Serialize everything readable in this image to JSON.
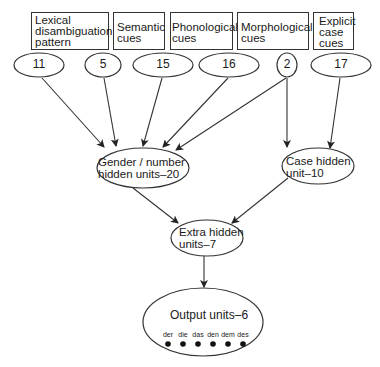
{
  "diagram": {
    "inputs": [
      {
        "label": "Lexical disambiguation pattern",
        "lines": [
          "Lexical",
          "disambiguation",
          "pattern"
        ],
        "units": "11"
      },
      {
        "label": "Semantic cues",
        "lines": [
          "Semantic",
          "cues"
        ],
        "units": "5"
      },
      {
        "label": "Phonological cues",
        "lines": [
          "Phonological",
          "cues"
        ],
        "units": "15"
      },
      {
        "label": "Morphological cues",
        "lines": [
          "Morphological",
          "cues"
        ],
        "units": "16"
      },
      {
        "label": "Morphological cues (2)",
        "units": "2"
      },
      {
        "label": "Explicit case cues",
        "lines": [
          "Explicit",
          "case",
          "cues"
        ],
        "units": "17"
      }
    ],
    "hidden": {
      "gender": {
        "lines": [
          "Gender / number",
          "hidden units–20"
        ]
      },
      "case": {
        "lines": [
          "Case hidden",
          "unit–10"
        ]
      },
      "extra": {
        "lines": [
          "Extra hidden",
          "units–7"
        ]
      }
    },
    "output": {
      "title": "Output units–6",
      "articles": [
        "der",
        "die",
        "das",
        "den",
        "dem",
        "des"
      ]
    },
    "edges": [
      [
        "11",
        "gender"
      ],
      [
        "5",
        "gender"
      ],
      [
        "15",
        "gender"
      ],
      [
        "16",
        "gender"
      ],
      [
        "2",
        "gender"
      ],
      [
        "2",
        "case"
      ],
      [
        "17",
        "case"
      ],
      [
        "gender",
        "extra"
      ],
      [
        "case",
        "extra"
      ],
      [
        "extra",
        "output"
      ]
    ]
  }
}
